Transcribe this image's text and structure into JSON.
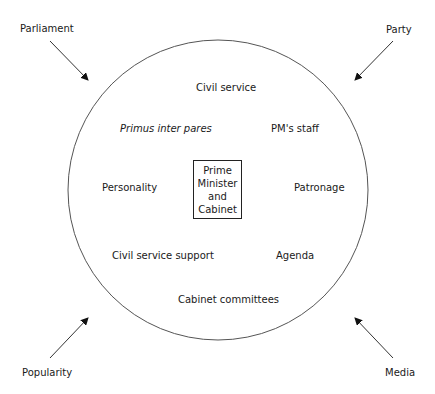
{
  "diagram": {
    "external_forces": {
      "top_left": "Parliament",
      "top_right": "Party",
      "bottom_left": "Popularity",
      "bottom_right": "Media"
    },
    "inner_factors": {
      "top": "Civil service",
      "upper_left": "Primus inter pares",
      "upper_right": "PM's staff",
      "left": "Personality",
      "right": "Patronage",
      "lower_left": "Civil service support",
      "lower_right": "Agenda",
      "bottom": "Cabinet committees"
    },
    "center": {
      "lines": [
        "Prime",
        "Minister",
        "and",
        "Cabinet"
      ]
    },
    "colors": {
      "stroke": "#444444",
      "text": "#1a1a1a",
      "background": "#ffffff"
    }
  }
}
